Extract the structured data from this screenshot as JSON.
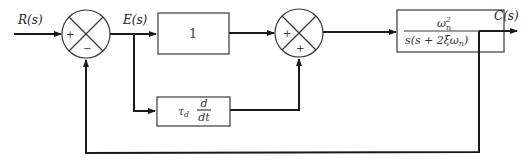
{
  "signals": {
    "input": "R(s)",
    "error": "E(s)",
    "output": "C(s)"
  },
  "summing_junctions": [
    {
      "id": "sum1",
      "signs": {
        "left": "+",
        "bottom": "−"
      }
    },
    {
      "id": "sum2",
      "signs": {
        "left": "+",
        "bottom": "+"
      }
    }
  ],
  "blocks": {
    "proportional": {
      "label": "1"
    },
    "derivative": {
      "coef": "τ",
      "coef_sub": "d",
      "num": "d",
      "den": "dt"
    },
    "plant": {
      "num": "ω",
      "num_sub": "n",
      "num_sup": "2",
      "den": "s(s + 2ξω",
      "den_sub": "n",
      "den_close": ")"
    }
  },
  "colors": {
    "line": "#1a1a1a",
    "box": "#3a3a3a",
    "background": "#ffffff"
  }
}
